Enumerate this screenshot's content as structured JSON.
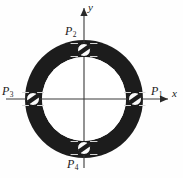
{
  "figure": {
    "name": "annular-flange-bolt-diagram",
    "background_color": "#fefefe",
    "width": 183,
    "height": 178
  },
  "axes": {
    "x_label": "x",
    "y_label": "y",
    "origin": {
      "x": 84,
      "y": 99
    },
    "x_axis": {
      "from_x": 6,
      "to_x": 170,
      "y": 99,
      "arrow": "right"
    },
    "y_axis": {
      "x": 84,
      "from_y": 168,
      "to_y": 6,
      "arrow": "up"
    },
    "line_color": "#3a3a3a"
  },
  "ring": {
    "name": "annulus",
    "center": {
      "x": 84,
      "y": 99
    },
    "outer_radius": 59,
    "inner_radius": 42,
    "fill_color": "#1c1c1c",
    "hole_fill_color": "#ffffff"
  },
  "bolts": [
    {
      "id": "P1",
      "label": "P",
      "subscript": "1",
      "position": {
        "x": 135,
        "y": 99
      },
      "angle_deg": 0,
      "radius": 6.5,
      "head_color": "#fbfbfb",
      "slot_color": "#1c1c1c",
      "slot_angle_deg": -35
    },
    {
      "id": "P2",
      "label": "P",
      "subscript": "2",
      "position": {
        "x": 84,
        "y": 50
      },
      "angle_deg": 90,
      "radius": 6.5,
      "head_color": "#fbfbfb",
      "slot_color": "#1c1c1c",
      "slot_angle_deg": -35
    },
    {
      "id": "P3",
      "label": "P",
      "subscript": "3",
      "position": {
        "x": 33,
        "y": 99
      },
      "angle_deg": 180,
      "radius": 6.5,
      "head_color": "#fbfbfb",
      "slot_color": "#1c1c1c",
      "slot_angle_deg": -35
    },
    {
      "id": "P4",
      "label": "P",
      "subscript": "4",
      "position": {
        "x": 84,
        "y": 148
      },
      "angle_deg": 270,
      "radius": 6.5,
      "head_color": "#fbfbfb",
      "slot_color": "#1c1c1c",
      "slot_angle_deg": -35
    }
  ],
  "tick_marks": {
    "color": "#d8d8d8",
    "note": "short centre-line ticks flanking each bolt"
  }
}
